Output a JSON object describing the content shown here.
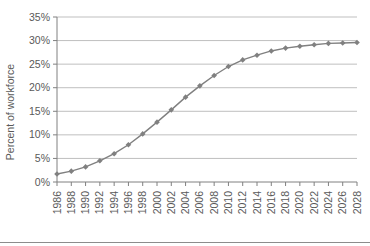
{
  "chart_data": {
    "type": "line",
    "title": "",
    "subtitle": "",
    "xlabel": "",
    "ylabel": "Percent of workforce",
    "xlim": [
      1986,
      2028
    ],
    "ylim": [
      0,
      35
    ],
    "ytick_labels": [
      "0%",
      "5%",
      "10%",
      "15%",
      "20%",
      "25%",
      "30%",
      "35%"
    ],
    "ytick_values": [
      0,
      5,
      10,
      15,
      20,
      25,
      30,
      35
    ],
    "ytick_suffix": "%",
    "xtick_labels": [
      "1986",
      "1988",
      "1990",
      "1992",
      "1994",
      "1996",
      "1998",
      "2000",
      "2002",
      "2004",
      "2006",
      "2008",
      "2010",
      "2012",
      "2014",
      "2016",
      "2018",
      "2020",
      "2022",
      "2024",
      "2026",
      "2028"
    ],
    "x": [
      1986,
      1988,
      1990,
      1992,
      1994,
      1996,
      1998,
      2000,
      2002,
      2004,
      2006,
      2008,
      2010,
      2012,
      2014,
      2016,
      2018,
      2020,
      2022,
      2024,
      2026,
      2028
    ],
    "values": [
      1.7,
      2.3,
      3.2,
      4.5,
      6.0,
      7.9,
      10.2,
      12.7,
      15.3,
      18.0,
      20.4,
      22.6,
      24.5,
      25.9,
      26.9,
      27.8,
      28.4,
      28.8,
      29.1,
      29.4,
      29.5,
      29.6
    ],
    "series": [
      {
        "name": "Percent of workforce",
        "values": [
          1.7,
          2.3,
          3.2,
          4.5,
          6.0,
          7.9,
          10.2,
          12.7,
          15.3,
          18.0,
          20.4,
          22.6,
          24.5,
          25.9,
          26.9,
          27.8,
          28.4,
          28.8,
          29.1,
          29.4,
          29.5,
          29.6
        ],
        "color": "#808080",
        "marker": "diamond"
      }
    ],
    "grid": {
      "horizontal": true,
      "vertical": false,
      "color": "#bfbfbf"
    },
    "legend": {
      "visible": false,
      "position": "none"
    },
    "xtick_label_rotation": -90
  },
  "colors": {
    "line": "#808080",
    "marker": "#808080",
    "gridline": "#bfbfbf",
    "axis": "#808080",
    "text": "#595959",
    "background": "#ffffff",
    "bottom_rule": "#8c8c8c"
  }
}
